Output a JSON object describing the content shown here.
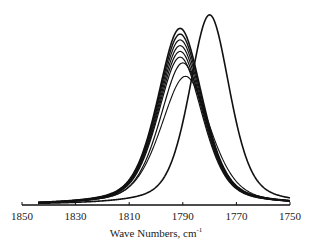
{
  "chart_data": {
    "type": "line",
    "title": "",
    "xlabel": "Wave Numbers,  cm",
    "xlabel_superscript": "-1",
    "ylabel": "",
    "xlim": [
      1850,
      1750
    ],
    "x_reversed": true,
    "xticks": [
      1850,
      1830,
      1810,
      1790,
      1770,
      1750
    ],
    "xtick_labels": [
      "1850",
      "1830",
      "1810",
      "1790",
      "1770",
      "1750"
    ],
    "ylim": [
      0,
      1
    ],
    "grid": false,
    "legend": null,
    "series": [
      {
        "name": "spectrum-1",
        "peak_position": 1791,
        "peak_height": 0.92,
        "width": 10.0,
        "stroke_width": 1.6
      },
      {
        "name": "spectrum-2",
        "peak_position": 1791,
        "peak_height": 0.89,
        "width": 10.0,
        "stroke_width": 1.4
      },
      {
        "name": "spectrum-3",
        "peak_position": 1791,
        "peak_height": 0.86,
        "width": 10.0,
        "stroke_width": 1.2
      },
      {
        "name": "spectrum-4",
        "peak_position": 1791,
        "peak_height": 0.83,
        "width": 10.0,
        "stroke_width": 1.2
      },
      {
        "name": "spectrum-5",
        "peak_position": 1791,
        "peak_height": 0.8,
        "width": 10.0,
        "stroke_width": 1.2
      },
      {
        "name": "spectrum-6",
        "peak_position": 1791,
        "peak_height": 0.77,
        "width": 10.0,
        "stroke_width": 1.2
      },
      {
        "name": "spectrum-7",
        "peak_position": 1790,
        "peak_height": 0.74,
        "width": 10.2,
        "stroke_width": 1.2
      },
      {
        "name": "spectrum-8",
        "peak_position": 1789,
        "peak_height": 0.67,
        "width": 11.0,
        "stroke_width": 1.1
      },
      {
        "name": "spectrum-shifted",
        "peak_position": 1780,
        "peak_height": 0.99,
        "width": 9.0,
        "stroke_width": 1.6
      }
    ]
  }
}
